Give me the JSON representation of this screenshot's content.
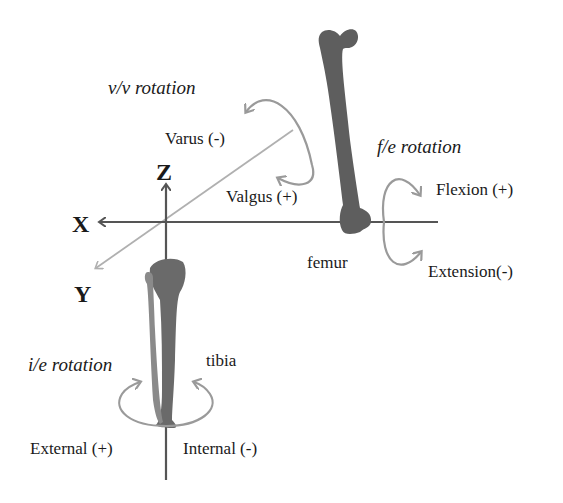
{
  "diagram": {
    "axes": {
      "x": "X",
      "y": "Y",
      "z": "Z"
    },
    "bones": {
      "femur": "femur",
      "tibia": "tibia"
    },
    "rotations": {
      "vv": {
        "title": "v/v rotation",
        "negative": "Varus (-)",
        "positive": "Valgus (+)"
      },
      "fe": {
        "title": "f/e rotation",
        "positive": "Flexion (+)",
        "negative": "Extension(-)"
      },
      "ie": {
        "title": "i/e rotation",
        "positive": "External (+)",
        "negative": "Internal (-)"
      }
    },
    "colors": {
      "axis": "#555555",
      "arrow": "#9a9a9a",
      "bone": "#5e5e5e",
      "y_axis": "#b0b0b0"
    }
  }
}
